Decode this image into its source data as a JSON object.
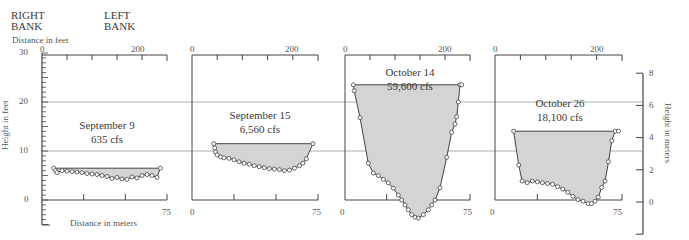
{
  "header": {
    "right_bank": [
      "RIGHT",
      "BANK"
    ],
    "left_bank": [
      "LEFT",
      "BANK"
    ],
    "distance_feet_label": "Distance in feet",
    "distance_meters_label": "Distance in meters",
    "height_feet_label": "Height in feet",
    "height_meters_label": "Height in meters"
  },
  "axes": {
    "feet_ticks": [
      "30",
      "20",
      "10",
      "0"
    ],
    "meter_ticks": [
      "8",
      "6",
      "4",
      "2",
      "0"
    ],
    "x_feet_ticks": [
      "0",
      "200"
    ],
    "x_meter_ticks": [
      "0",
      "75"
    ]
  },
  "panels": [
    {
      "date": "September 9",
      "flow": "635 cfs"
    },
    {
      "date": "September 15",
      "flow": "6,560 cfs"
    },
    {
      "date": "October 14",
      "flow": "59,600 cfs"
    },
    {
      "date": "October 26",
      "flow": "18,100 cfs"
    }
  ],
  "colors": {
    "fill": "#d4d4d4",
    "line": "#444444",
    "grid": "#999999"
  },
  "chart_data": [
    {
      "type": "area",
      "title": "September 9",
      "subtitle": "635 cfs",
      "xlabel": "Distance in meters",
      "ylabel": "Height in feet",
      "xlim": [
        0,
        75
      ],
      "ylim": [
        -5,
        30
      ],
      "water_surface_ft": 6.5,
      "x": [
        7,
        8,
        9,
        12,
        15,
        18,
        21,
        24,
        27,
        30,
        33,
        36,
        39,
        42,
        45,
        48,
        51,
        54,
        57,
        60,
        63,
        66,
        69,
        71
      ],
      "bed_height_ft": [
        6.5,
        6.0,
        5.6,
        6.0,
        5.9,
        5.8,
        5.7,
        5.6,
        5.4,
        5.3,
        5.2,
        5.0,
        4.8,
        4.4,
        4.6,
        4.3,
        4.2,
        4.7,
        4.5,
        5.0,
        5.2,
        5.0,
        4.6,
        6.5
      ]
    },
    {
      "type": "area",
      "title": "September 15",
      "subtitle": "6,560 cfs",
      "xlabel": "Distance in meters",
      "ylabel": "Height in feet",
      "xlim": [
        0,
        75
      ],
      "ylim": [
        -5,
        30
      ],
      "water_surface_ft": 11.5,
      "x": [
        13,
        13.5,
        14,
        15,
        17,
        19,
        22,
        25,
        28,
        31,
        34,
        37,
        40,
        43,
        46,
        49,
        52,
        55,
        58,
        61,
        64,
        66,
        68,
        72
      ],
      "bed_height_ft": [
        11.5,
        10.6,
        9.8,
        9.2,
        8.8,
        8.6,
        8.5,
        8.2,
        7.8,
        7.5,
        7.3,
        7.0,
        6.8,
        6.6,
        6.4,
        6.3,
        6.2,
        6.0,
        6.1,
        6.5,
        7.0,
        7.5,
        8.4,
        11.5
      ]
    },
    {
      "type": "area",
      "title": "October 14",
      "subtitle": "59,600 cfs",
      "xlabel": "Distance in meters",
      "ylabel": "Height in feet",
      "xlim": [
        0,
        75
      ],
      "ylim": [
        -5,
        30
      ],
      "water_surface_ft": 23.5,
      "x": [
        5,
        5.5,
        9,
        14,
        17,
        20,
        23,
        26,
        29,
        32,
        34,
        36,
        38,
        40,
        42,
        44,
        47,
        50,
        52,
        54,
        57,
        61,
        64,
        66,
        67,
        68,
        69,
        70
      ],
      "bed_height_ft": [
        23.5,
        22.3,
        16.8,
        7.5,
        5.5,
        5.0,
        4.2,
        3.5,
        2.4,
        1.0,
        0.0,
        -1.0,
        -2.0,
        -3.0,
        -3.5,
        -3.7,
        -3.0,
        -2.0,
        -1.0,
        0.0,
        2.5,
        8.7,
        13.8,
        15.5,
        17.0,
        20.0,
        23.5,
        23.5
      ]
    },
    {
      "type": "area",
      "title": "October 26",
      "subtitle": "18,100 cfs",
      "xlabel": "Distance in meters",
      "ylabel": "Height in meters",
      "xlim": [
        0,
        75
      ],
      "ylim": [
        -2,
        8
      ],
      "water_surface_m": 4.4,
      "x": [
        11,
        14,
        16,
        19,
        22,
        25,
        28,
        31,
        34,
        37,
        40,
        43,
        46,
        49,
        52,
        55,
        57,
        59,
        61,
        63,
        65,
        67,
        69,
        71,
        73
      ],
      "bed_height_m": [
        4.4,
        2.3,
        1.3,
        1.2,
        1.3,
        1.25,
        1.2,
        1.15,
        1.1,
        0.95,
        0.8,
        0.6,
        0.35,
        0.15,
        0.05,
        -0.1,
        -0.1,
        0.05,
        0.3,
        0.9,
        1.3,
        2.5,
        3.8,
        4.4,
        4.4
      ]
    }
  ]
}
